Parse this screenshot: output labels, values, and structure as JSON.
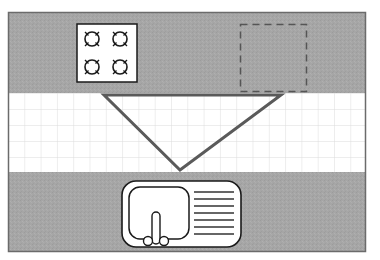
{
  "diagram": {
    "type": "kitchen-work-triangle-floor-plan",
    "colors": {
      "counter": "#a6a6a6",
      "frame": "#6b6b6b",
      "floor": "#ffffff",
      "grid": "#dcdcdc",
      "triangle": "#5a5a5a",
      "appliance_fill": "#ffffff",
      "appliance_stroke": "#1a1a1a",
      "dashed": "#555555"
    },
    "elements": {
      "top_counter": {
        "label": ""
      },
      "floor_grid": {
        "label": ""
      },
      "bottom_counter": {
        "label": ""
      },
      "stove": {
        "burners": 4
      },
      "refrigerator_outline": {
        "style": "dashed"
      },
      "work_triangle": {
        "vertices": [
          "stove",
          "refrigerator",
          "sink"
        ]
      },
      "sink": {
        "drainer_lines": 7
      }
    }
  }
}
